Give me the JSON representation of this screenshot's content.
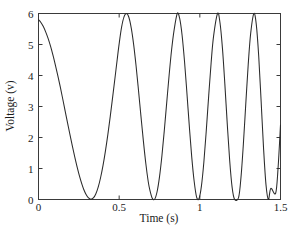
{
  "chart_data": {
    "type": "line",
    "title": "",
    "xlabel": "Time (s)",
    "ylabel": "Voltage (v)",
    "xlim": [
      0,
      1.5
    ],
    "ylim": [
      0,
      6
    ],
    "xticks": [
      0,
      0.5,
      1,
      1.5
    ],
    "xticklabels": [
      "0",
      "0.5",
      "1",
      "1.5"
    ],
    "yticks": [
      0,
      1,
      2,
      3,
      4,
      5,
      6
    ],
    "yticklabels": [
      "0",
      "1",
      "2",
      "3",
      "4",
      "5",
      "6"
    ],
    "grid": false,
    "legend": null,
    "frame": "box",
    "tick_direction": "in",
    "series": [
      {
        "name": "voltage",
        "description": "Rectified-style chirped sinusoid, amplitude 0..6 V, frequency increasing with time",
        "color": "#2b2b2b",
        "line_width": 1.05,
        "amplitude": 6,
        "offset": 3,
        "start_value": 5.8,
        "end_value": 2.4,
        "minima_t": [
          0.28,
          0.69,
          0.98,
          1.24,
          1.47
        ],
        "maxima_t": [
          0.5,
          0.86,
          1.11,
          1.35
        ],
        "minima_v": [
          0,
          0,
          0,
          0,
          0
        ],
        "maxima_v": [
          6,
          6,
          6,
          6
        ],
        "x": [
          0.0,
          0.015,
          0.03,
          0.045,
          0.06,
          0.075,
          0.09,
          0.105,
          0.12,
          0.135,
          0.15,
          0.165,
          0.18,
          0.195,
          0.21,
          0.225,
          0.24,
          0.255,
          0.27,
          0.28,
          0.295,
          0.31,
          0.325,
          0.34,
          0.355,
          0.37,
          0.385,
          0.4,
          0.415,
          0.43,
          0.445,
          0.46,
          0.475,
          0.49,
          0.5,
          0.515,
          0.53,
          0.545,
          0.56,
          0.575,
          0.59,
          0.605,
          0.62,
          0.635,
          0.65,
          0.665,
          0.68,
          0.69,
          0.705,
          0.72,
          0.735,
          0.75,
          0.765,
          0.78,
          0.795,
          0.81,
          0.825,
          0.84,
          0.86,
          0.875,
          0.89,
          0.905,
          0.92,
          0.935,
          0.95,
          0.965,
          0.98,
          0.995,
          1.01,
          1.025,
          1.04,
          1.055,
          1.07,
          1.085,
          1.11,
          1.125,
          1.14,
          1.155,
          1.17,
          1.185,
          1.2,
          1.215,
          1.24,
          1.255,
          1.27,
          1.285,
          1.3,
          1.315,
          1.335,
          1.35,
          1.365,
          1.38,
          1.395,
          1.41,
          1.425,
          1.44,
          1.47,
          1.485,
          1.5
        ],
        "y": [
          5.8,
          5.71,
          5.58,
          5.4,
          5.19,
          4.94,
          4.65,
          4.33,
          3.99,
          3.63,
          3.25,
          2.86,
          2.47,
          2.09,
          1.72,
          1.37,
          1.04,
          0.74,
          0.48,
          0.33,
          0.16,
          0.05,
          0.01,
          0.05,
          0.18,
          0.4,
          0.71,
          1.1,
          1.57,
          2.1,
          2.69,
          3.32,
          3.96,
          4.61,
          5.03,
          5.56,
          5.89,
          6.0,
          5.88,
          5.53,
          4.99,
          4.3,
          3.51,
          2.69,
          1.89,
          1.17,
          0.58,
          0.31,
          0.04,
          0.01,
          0.25,
          0.73,
          1.41,
          2.24,
          3.14,
          4.03,
          4.83,
          5.45,
          6.0,
          5.84,
          5.3,
          4.46,
          3.43,
          2.35,
          1.36,
          0.58,
          0.08,
          0.03,
          0.44,
          1.21,
          2.23,
          3.35,
          4.41,
          5.26,
          6.0,
          5.7,
          4.89,
          3.73,
          2.44,
          1.26,
          0.4,
          0.01,
          0.06,
          0.71,
          1.8,
          3.1,
          4.36,
          5.35,
          6.0,
          5.64,
          4.62,
          3.16,
          1.65,
          0.48,
          0.0,
          0.36,
          0.2,
          1.02,
          2.4
        ]
      }
    ]
  },
  "axes": {
    "x_label": "Time (s)",
    "y_label": "Voltage (v)",
    "x_tick_labels": [
      "0",
      "0.5",
      "1",
      "1.5"
    ],
    "y_tick_labels": [
      "0",
      "1",
      "2",
      "3",
      "4",
      "5",
      "6"
    ]
  },
  "colors": {
    "background": "#ffffff",
    "axis": "#3a3a3a",
    "curve": "#2b2b2b",
    "text": "#1a1a1a"
  }
}
